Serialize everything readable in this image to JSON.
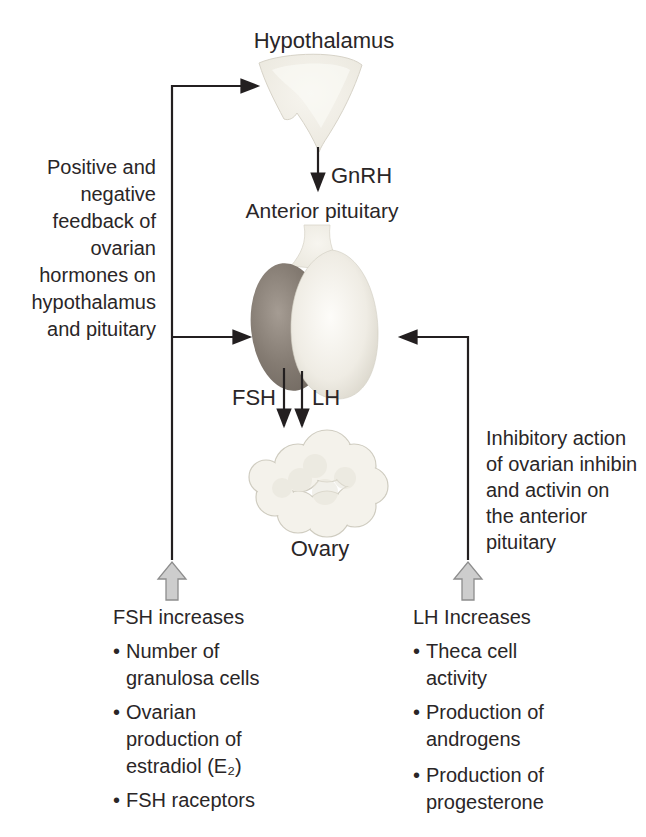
{
  "figure": {
    "hypothalamus_label": "Hypothalamus",
    "gnrh_label": "GnRH",
    "anterior_pituitary_label": "Anterior pituitary",
    "fsh_label": "FSH",
    "lh_label": "LH",
    "ovary_label": "Ovary"
  },
  "left_note": {
    "lines": [
      "Positive and",
      "negative",
      "feedback of",
      "ovarian",
      "hormones on",
      "hypothalamus",
      "and pituitary"
    ]
  },
  "right_note": {
    "lines": [
      "Inhibitory action",
      "of ovarian inhibin",
      "and activin on",
      "the anterior",
      "pituitary"
    ]
  },
  "bullet_char": "•",
  "fsh_list": {
    "heading": "FSH increases",
    "items": [
      {
        "lines": [
          "Number of",
          "granulosa cells"
        ]
      },
      {
        "lines": [
          "Ovarian",
          "production of",
          "estradiol (E₂)"
        ]
      },
      {
        "lines": [
          "FSH raceptors"
        ]
      }
    ]
  },
  "lh_list": {
    "heading": "LH Increases",
    "items": [
      {
        "lines": [
          "Theca cell",
          "activity"
        ]
      },
      {
        "lines": [
          "Production  of",
          "androgens"
        ]
      },
      {
        "lines": [
          "Production of",
          "progesterone"
        ]
      }
    ]
  },
  "colors": {
    "feedback_line": "#231f20",
    "text": "#2a2627",
    "block_arrow_fill": "#cdcdcd",
    "block_arrow_stroke": "#8d8d8d",
    "posterior_lobe": "#847b72",
    "anterior_lobe": "#efece4",
    "tissue_fill": "#f2f0e9"
  }
}
